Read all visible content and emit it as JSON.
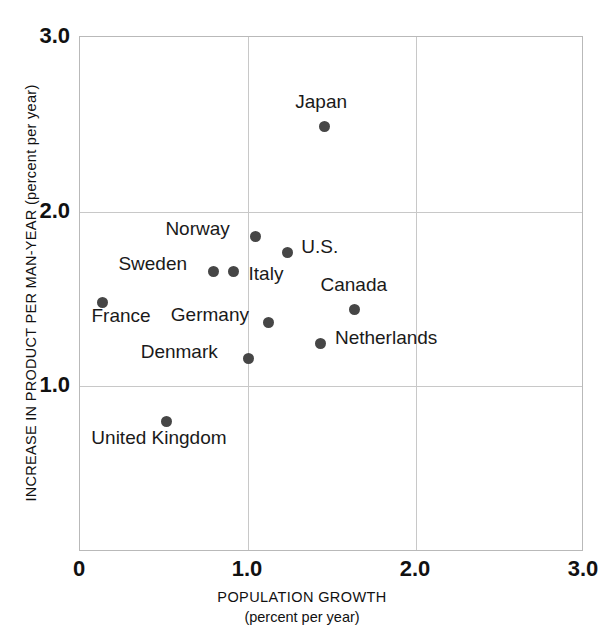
{
  "chart_data": {
    "type": "scatter",
    "title": "",
    "xlabel": "POPULATION GROWTH",
    "xlabel_sub": "(percent per year)",
    "ylabel": "INCREASE IN PRODUCT PER MAN-YEAR (percent per year)",
    "xlim": [
      0,
      3.0
    ],
    "ylim": [
      0,
      3.0
    ],
    "grid": true,
    "legend": "none",
    "xticks": [
      {
        "value": 0,
        "label": "0"
      },
      {
        "value": 1.0,
        "label": "1.0"
      },
      {
        "value": 2.0,
        "label": "2.0"
      },
      {
        "value": 3.0,
        "label": "3.0"
      }
    ],
    "yticks": [
      {
        "value": 1.0,
        "label": "1.0"
      },
      {
        "value": 2.0,
        "label": "2.0"
      },
      {
        "value": 3.0,
        "label": "3.0"
      }
    ],
    "marker_color": "#464646",
    "grid_color": "#c8c8c8",
    "points": [
      {
        "label": "Japan",
        "x": 1.46,
        "y": 2.48,
        "label_dx": -29,
        "label_dy": -26,
        "label_align": "left"
      },
      {
        "label": "Norway",
        "x": 1.05,
        "y": 1.85,
        "label_dx": -90,
        "label_dy": -9,
        "label_align": "left"
      },
      {
        "label": "U.S.",
        "x": 1.24,
        "y": 1.76,
        "label_dx": 14,
        "label_dy": -6,
        "label_align": "left"
      },
      {
        "label": "Sweden",
        "x": 0.8,
        "y": 1.65,
        "label_dx": -95,
        "label_dy": -9,
        "label_align": "left"
      },
      {
        "label": "",
        "x": 0.92,
        "y": 1.65,
        "label_dx": 0,
        "label_dy": 0,
        "label_align": "left"
      },
      {
        "label": "Italy",
        "x": 0.92,
        "y": 1.65,
        "label_dx": 15,
        "label_dy": 1,
        "label_align": "left"
      },
      {
        "label": "France",
        "x": 0.14,
        "y": 1.47,
        "label_dx": -11,
        "label_dy": 12,
        "label_align": "left"
      },
      {
        "label": "Canada",
        "x": 1.64,
        "y": 1.43,
        "label_dx": -34,
        "label_dy": -26,
        "label_align": "left"
      },
      {
        "label": "Germany",
        "x": 1.13,
        "y": 1.36,
        "label_dx": -98,
        "label_dy": -8,
        "label_align": "left"
      },
      {
        "label": "Netherlands",
        "x": 1.44,
        "y": 1.24,
        "label_dx": 14,
        "label_dy": -6,
        "label_align": "left"
      },
      {
        "label": "Denmark",
        "x": 1.01,
        "y": 1.15,
        "label_dx": -108,
        "label_dy": -8,
        "label_align": "left"
      },
      {
        "label": "United Kingdom",
        "x": 0.52,
        "y": 0.79,
        "label_dx": -75,
        "label_dy": 15,
        "label_align": "left"
      }
    ]
  }
}
